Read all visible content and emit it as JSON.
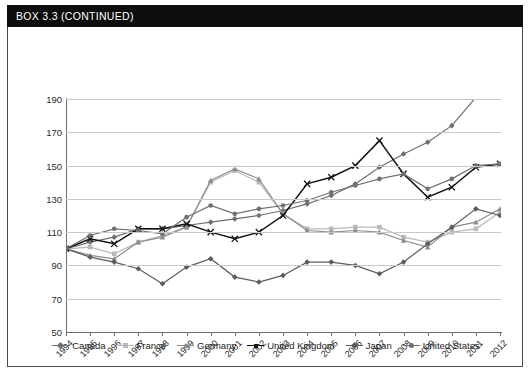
{
  "header": {
    "title": "BOX 3.3  (CONTINUED)"
  },
  "chart_data": {
    "type": "line",
    "title": "",
    "subtitle": "",
    "xlabel": "",
    "ylabel": "",
    "grid": true,
    "legend_position": "bottom",
    "xlim": [
      1994,
      2012
    ],
    "ylim": [
      50,
      190
    ],
    "ytick_step": 20,
    "ytick_labels": [
      "190",
      "170",
      "150",
      "130",
      "110",
      "90",
      "70",
      "50"
    ],
    "ytick_values": [
      190,
      170,
      150,
      130,
      110,
      90,
      70,
      50
    ],
    "categories": [
      "1994",
      "1995",
      "1996",
      "1997",
      "1998",
      "1999",
      "2000",
      "2001",
      "2002",
      "2003",
      "2004",
      "2005",
      "2006",
      "2007",
      "2008",
      "2009",
      "2010",
      "2011",
      "2012"
    ],
    "x": [
      1994,
      1995,
      1996,
      1997,
      1998,
      1999,
      2000,
      2001,
      2002,
      2003,
      2004,
      2005,
      2006,
      2007,
      2008,
      2009,
      2010,
      2011,
      2012
    ],
    "series": [
      {
        "name": "Canada",
        "color": "#6f6f6f",
        "marker": "diamond",
        "values": [
          100,
          104,
          107,
          112,
          112,
          114,
          116,
          118,
          120,
          123,
          127,
          132,
          139,
          149,
          157,
          164,
          174,
          191,
          193
        ]
      },
      {
        "name": "France",
        "color": "#b9b9b9",
        "marker": "square",
        "values": [
          100,
          101,
          97,
          104,
          108,
          113,
          140,
          147,
          140,
          121,
          112,
          112,
          113,
          113,
          107,
          104,
          110,
          112,
          122
        ]
      },
      {
        "name": "Germany",
        "color": "#8d8d8d",
        "marker": "triangle",
        "values": [
          100,
          96,
          94,
          104,
          107,
          113,
          141,
          148,
          142,
          121,
          111,
          110,
          111,
          110,
          105,
          101,
          113,
          116,
          124
        ]
      },
      {
        "name": "United Kingdom",
        "color": "#121212",
        "marker": "cross",
        "values": [
          100,
          106,
          103,
          112,
          112,
          115,
          110,
          106,
          110,
          120,
          139,
          143,
          150,
          165,
          145,
          131,
          137,
          149,
          151
        ]
      },
      {
        "name": "Japan",
        "color": "#5c5c5c",
        "marker": "diamond",
        "values": [
          100,
          95,
          92,
          88,
          79,
          89,
          94,
          83,
          80,
          84,
          92,
          92,
          90,
          85,
          92,
          103,
          113,
          124,
          120
        ]
      },
      {
        "name": "United States",
        "color": "#707070",
        "marker": "dot",
        "values": [
          100,
          108,
          112,
          111,
          109,
          119,
          126,
          121,
          124,
          126,
          129,
          134,
          138,
          142,
          145,
          136,
          142,
          150,
          151
        ]
      }
    ]
  },
  "legend": {
    "entries": [
      "Canada",
      "France",
      "Germany",
      "United Kingdom",
      "Japan",
      "United States"
    ]
  }
}
